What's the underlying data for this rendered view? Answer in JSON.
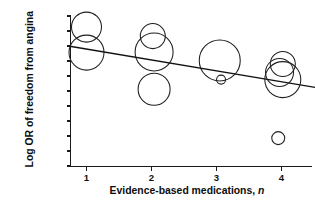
{
  "chart_data": {
    "type": "scatter",
    "title": "",
    "xlabel": "Evidence-based medications, n",
    "xlabel_plain": "Evidence-based medications,",
    "xlabel_italic": "n",
    "ylabel": "Log OR of freedom from angina",
    "xlim": [
      0.55,
      4.5
    ],
    "ylim": [
      -3.0,
      2.0
    ],
    "xticks": [
      1,
      2,
      3,
      4
    ],
    "xtick_labels": [
      "1",
      "2",
      "3",
      "4"
    ],
    "yticks": [
      2.0,
      1.5,
      1.0,
      0.5,
      0.0,
      -0.5,
      -1.0,
      -1.5,
      -2.0,
      -2.5,
      -3.0
    ],
    "ytick_labels": [
      "2.00",
      "1.50",
      "1.00",
      "0.50",
      "0.00",
      "−0.50",
      "−1.00",
      "−1.50",
      "−2.00",
      "−2.50",
      "−3.00"
    ],
    "grid": false,
    "legend": false,
    "marker": "open-circle",
    "size_encoding": "bubble-area-by-study-weight",
    "points": [
      {
        "label": "n1-upper",
        "x": 1.0,
        "y": 1.63,
        "r": 15.0
      },
      {
        "label": "n1-lower",
        "x": 1.0,
        "y": 0.78,
        "r": 17.5
      },
      {
        "label": "n2-upper",
        "x": 2.02,
        "y": 1.33,
        "r": 12.5
      },
      {
        "label": "n2-mid",
        "x": 2.04,
        "y": 0.8,
        "r": 19.0
      },
      {
        "label": "n2-low",
        "x": 2.04,
        "y": -0.44,
        "r": 16.0
      },
      {
        "label": "n3-large",
        "x": 3.05,
        "y": 0.52,
        "r": 20.5
      },
      {
        "label": "n3-small",
        "x": 3.07,
        "y": -0.12,
        "r": 4.5
      },
      {
        "label": "n4-upper",
        "x": 4.02,
        "y": 0.4,
        "r": 12.5
      },
      {
        "label": "n4-mid",
        "x": 3.97,
        "y": 0.12,
        "r": 14.0
      },
      {
        "label": "n4-lower",
        "x": 4.02,
        "y": -0.12,
        "r": 18.0
      },
      {
        "label": "n4-outlier",
        "x": 3.95,
        "y": -2.07,
        "r": 6.5
      }
    ],
    "fit_line": {
      "label": "regression-line",
      "x_start": 0.72,
      "y_start": 1.0,
      "x_end": 4.6,
      "y_end": -0.41,
      "slope": -0.363,
      "intercept": 1.26
    }
  }
}
